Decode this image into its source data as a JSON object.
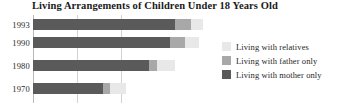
{
  "chart_data": {
    "type": "bar",
    "orientation": "horizontal",
    "stacked": true,
    "title": "Living Arrangements of Children Under 18 Years Old",
    "xlabel": "",
    "ylabel": "",
    "categories": [
      "1993",
      "1990",
      "1980",
      "1970"
    ],
    "xlim": [
      0,
      100
    ],
    "grid": true,
    "gridlines": [
      25,
      50
    ],
    "legend_position": "right",
    "series": [
      {
        "name": "Living with mother only",
        "color": "#5a5a5a",
        "values": [
          81,
          78,
          66,
          40
        ]
      },
      {
        "name": "Living with father only",
        "color": "#a8a8a8",
        "values": [
          9,
          9,
          5,
          4
        ]
      },
      {
        "name": "Living with relatives",
        "color": "#e8e8e8",
        "values": [
          7,
          8,
          10,
          9
        ]
      }
    ]
  },
  "axis": {
    "year_labels": [
      "1993",
      "1990",
      "1980",
      "1970"
    ]
  },
  "legend": {
    "items": [
      {
        "label": "Living with relatives",
        "color": "#e8e8e8"
      },
      {
        "label": "Living with father only",
        "color": "#a8a8a8"
      },
      {
        "label": "Living with mother only",
        "color": "#5a5a5a"
      }
    ]
  }
}
